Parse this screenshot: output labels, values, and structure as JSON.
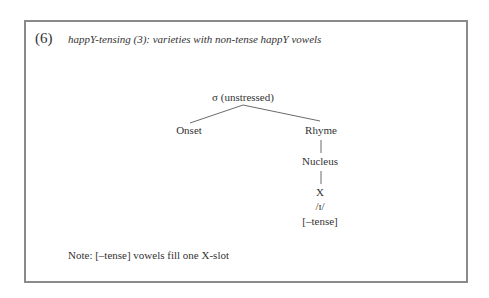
{
  "example": {
    "number": "(6)",
    "title": "happY-tensing (3): varieties with non-tense happY vowels"
  },
  "tree": {
    "root": "σ (unstressed)",
    "left_child": "Onset",
    "right_child": "Rhyme",
    "nucleus": "Nucleus",
    "slot": "X",
    "vowel": "/ɪ/",
    "feature": "[–tense]"
  },
  "note": "Note: [–tense] vowels fill one X-slot"
}
